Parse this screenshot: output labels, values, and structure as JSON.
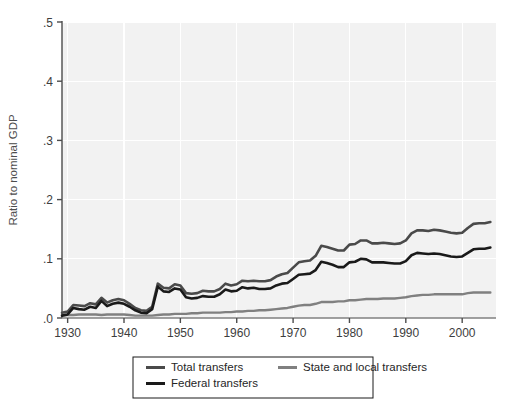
{
  "chart_data": {
    "type": "line",
    "title": "",
    "subtitle": "",
    "xlabel": "",
    "ylabel": "Ratio to nominal GDP",
    "xlim": [
      1929,
      2006
    ],
    "ylim": [
      0.0,
      0.5
    ],
    "xticks": [
      1930,
      1940,
      1950,
      1960,
      1970,
      1980,
      1990,
      2000
    ],
    "xtick_labels": [
      "1930",
      "1940",
      "1950",
      "1960",
      "1970",
      "1980",
      "1990",
      "2000"
    ],
    "yticks": [
      0.0,
      0.1,
      0.2,
      0.3,
      0.4,
      0.5
    ],
    "ytick_labels": [
      ".0",
      ".1",
      ".2",
      ".3",
      ".4",
      ".5"
    ],
    "grid": true,
    "grid_color": "#ffffff",
    "plot_background": "#f2f2f2",
    "legend_position": "below-center",
    "x": [
      1929,
      1930,
      1931,
      1932,
      1933,
      1934,
      1935,
      1936,
      1937,
      1938,
      1939,
      1940,
      1941,
      1942,
      1943,
      1944,
      1945,
      1946,
      1947,
      1948,
      1949,
      1950,
      1951,
      1952,
      1953,
      1954,
      1955,
      1956,
      1957,
      1958,
      1959,
      1960,
      1961,
      1962,
      1963,
      1964,
      1965,
      1966,
      1967,
      1968,
      1969,
      1970,
      1971,
      1972,
      1973,
      1974,
      1975,
      1976,
      1977,
      1978,
      1979,
      1980,
      1981,
      1982,
      1983,
      1984,
      1985,
      1986,
      1987,
      1988,
      1989,
      1990,
      1991,
      1992,
      1993,
      1994,
      1995,
      1996,
      1997,
      1998,
      1999,
      2000,
      2001,
      2002,
      2003,
      2004,
      2005
    ],
    "series": [
      {
        "name": "Total transfers",
        "color": "#4a4a4a",
        "width": 2.6,
        "values": [
          0.009,
          0.011,
          0.022,
          0.021,
          0.02,
          0.025,
          0.023,
          0.034,
          0.026,
          0.03,
          0.032,
          0.03,
          0.024,
          0.017,
          0.013,
          0.012,
          0.019,
          0.058,
          0.051,
          0.05,
          0.057,
          0.055,
          0.042,
          0.041,
          0.042,
          0.046,
          0.045,
          0.045,
          0.049,
          0.058,
          0.055,
          0.057,
          0.063,
          0.062,
          0.063,
          0.062,
          0.062,
          0.064,
          0.07,
          0.074,
          0.076,
          0.085,
          0.094,
          0.096,
          0.097,
          0.105,
          0.122,
          0.12,
          0.117,
          0.114,
          0.114,
          0.124,
          0.125,
          0.131,
          0.131,
          0.126,
          0.126,
          0.127,
          0.126,
          0.125,
          0.126,
          0.131,
          0.143,
          0.148,
          0.148,
          0.147,
          0.149,
          0.148,
          0.146,
          0.144,
          0.143,
          0.144,
          0.152,
          0.159,
          0.16,
          0.16,
          0.162
        ]
      },
      {
        "name": "Federal transfers",
        "color": "#1a1a1a",
        "width": 2.6,
        "values": [
          0.004,
          0.006,
          0.017,
          0.015,
          0.014,
          0.019,
          0.017,
          0.029,
          0.02,
          0.024,
          0.026,
          0.024,
          0.019,
          0.013,
          0.009,
          0.008,
          0.015,
          0.053,
          0.045,
          0.044,
          0.05,
          0.048,
          0.035,
          0.033,
          0.034,
          0.037,
          0.036,
          0.036,
          0.04,
          0.048,
          0.045,
          0.046,
          0.052,
          0.05,
          0.051,
          0.049,
          0.049,
          0.05,
          0.055,
          0.058,
          0.059,
          0.066,
          0.073,
          0.074,
          0.075,
          0.081,
          0.095,
          0.093,
          0.09,
          0.086,
          0.086,
          0.094,
          0.095,
          0.1,
          0.099,
          0.094,
          0.094,
          0.094,
          0.093,
          0.092,
          0.092,
          0.096,
          0.106,
          0.11,
          0.109,
          0.108,
          0.109,
          0.108,
          0.106,
          0.104,
          0.103,
          0.104,
          0.11,
          0.116,
          0.117,
          0.117,
          0.119
        ]
      },
      {
        "name": "State and local transfers",
        "color": "#808080",
        "width": 2.4,
        "values": [
          0.005,
          0.005,
          0.005,
          0.006,
          0.006,
          0.006,
          0.006,
          0.005,
          0.006,
          0.006,
          0.006,
          0.006,
          0.005,
          0.004,
          0.004,
          0.004,
          0.004,
          0.005,
          0.006,
          0.006,
          0.007,
          0.007,
          0.007,
          0.008,
          0.008,
          0.009,
          0.009,
          0.009,
          0.009,
          0.01,
          0.01,
          0.011,
          0.011,
          0.012,
          0.012,
          0.013,
          0.013,
          0.014,
          0.015,
          0.016,
          0.017,
          0.019,
          0.021,
          0.022,
          0.022,
          0.024,
          0.027,
          0.027,
          0.027,
          0.028,
          0.028,
          0.03,
          0.03,
          0.031,
          0.032,
          0.032,
          0.032,
          0.033,
          0.033,
          0.033,
          0.034,
          0.035,
          0.037,
          0.038,
          0.039,
          0.039,
          0.04,
          0.04,
          0.04,
          0.04,
          0.04,
          0.04,
          0.042,
          0.043,
          0.043,
          0.043,
          0.043
        ]
      }
    ],
    "legend": [
      {
        "label": "Total transfers",
        "color": "#4a4a4a"
      },
      {
        "label": "Federal transfers",
        "color": "#1a1a1a"
      },
      {
        "label": "State and local transfers",
        "color": "#808080"
      }
    ]
  }
}
